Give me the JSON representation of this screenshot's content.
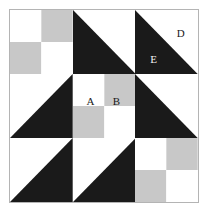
{
  "figure": {
    "kind": "quilt-block-diagram",
    "title": "",
    "grid_rows": 3,
    "grid_cols": 3,
    "colors": {
      "dark": "#1a1a1a",
      "light": "#ffffff",
      "medium": "#c8c8c8",
      "outline": "#b4b4b4",
      "label_on_light": "#1a1a1a",
      "label_on_dark": "#f2f2f2",
      "background": "#ffffff"
    },
    "cells": [
      {
        "id": "r1c1",
        "name": "four-patch",
        "pattern": "four-patch",
        "quadrants": [
          "light",
          "medium",
          "medium",
          "light"
        ],
        "labels": []
      },
      {
        "id": "r1c2",
        "name": "half-square-triangle",
        "pattern": "hst",
        "diagonal": "tl-br",
        "upper_right": "light",
        "lower_left": "dark",
        "labels": []
      },
      {
        "id": "r1c3",
        "name": "half-square-triangle",
        "pattern": "hst",
        "diagonal": "tl-br",
        "upper_right": "light",
        "lower_left": "dark",
        "labels": [
          {
            "text": "D",
            "on": "light",
            "position": "lbl-d"
          },
          {
            "text": "E",
            "on": "dark",
            "position": "lbl-e"
          }
        ]
      },
      {
        "id": "r2c1",
        "name": "half-square-triangle",
        "pattern": "hst",
        "diagonal": "bl-tr",
        "upper_right": "dark",
        "lower_left": "light",
        "labels": []
      },
      {
        "id": "r2c2",
        "name": "four-patch",
        "pattern": "four-patch",
        "quadrants": [
          "light",
          "medium",
          "medium",
          "light"
        ],
        "labels": [
          {
            "text": "A",
            "on": "light",
            "position": "lbl-a"
          },
          {
            "text": "B",
            "on": "medium",
            "position": "lbl-b"
          }
        ]
      },
      {
        "id": "r2c3",
        "name": "half-square-triangle",
        "pattern": "hst",
        "diagonal": "tl-br",
        "upper_right": "light",
        "lower_left": "dark",
        "labels": []
      },
      {
        "id": "r3c1",
        "name": "half-square-triangle",
        "pattern": "hst",
        "diagonal": "bl-tr",
        "upper_right": "dark",
        "lower_left": "light",
        "labels": []
      },
      {
        "id": "r3c2",
        "name": "half-square-triangle",
        "pattern": "hst",
        "diagonal": "bl-tr",
        "upper_right": "dark",
        "lower_left": "light",
        "labels": []
      },
      {
        "id": "r3c3",
        "name": "four-patch",
        "pattern": "four-patch",
        "quadrants": [
          "light",
          "medium",
          "medium",
          "light"
        ],
        "labels": []
      }
    ],
    "visible_labels": [
      "A",
      "B",
      "D",
      "E"
    ]
  }
}
